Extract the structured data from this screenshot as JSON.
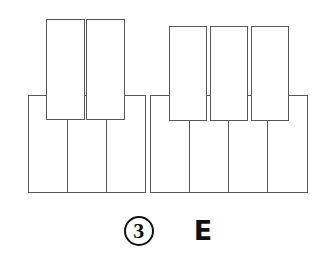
{
  "diagram": {
    "kind": "piano-keyboard",
    "octaves": 1,
    "white_key_count": 7,
    "black_key_count": 5,
    "white_key_names": [
      "C",
      "D",
      "E",
      "F",
      "G",
      "A",
      "B"
    ],
    "black_key_names": [
      "C#",
      "D#",
      "F#",
      "G#",
      "A#"
    ],
    "highlighted_note": "E",
    "outline_color": "#58585a",
    "fill_color": "#ffffff",
    "white_keys": [
      {
        "name": "white-key-c",
        "label": "C",
        "left": 28,
        "top": 95,
        "width": 41,
        "height": 98
      },
      {
        "name": "white-key-d",
        "label": "D",
        "left": 67,
        "top": 95,
        "width": 41,
        "height": 98
      },
      {
        "name": "white-key-e",
        "label": "E",
        "left": 106,
        "top": 95,
        "width": 40,
        "height": 98
      },
      {
        "name": "white-key-f",
        "label": "F",
        "left": 150,
        "top": 95,
        "width": 41,
        "height": 98
      },
      {
        "name": "white-key-g",
        "label": "G",
        "left": 189,
        "top": 95,
        "width": 41,
        "height": 98
      },
      {
        "name": "white-key-a",
        "label": "A",
        "left": 228,
        "top": 95,
        "width": 41,
        "height": 98
      },
      {
        "name": "white-key-b",
        "label": "B",
        "left": 267,
        "top": 95,
        "width": 41,
        "height": 98
      }
    ],
    "black_keys": [
      {
        "name": "black-key-c-sharp",
        "label": "C#",
        "left": 46,
        "top": 19,
        "width": 39,
        "height": 101
      },
      {
        "name": "black-key-d-sharp",
        "label": "D#",
        "left": 86,
        "top": 19,
        "width": 39,
        "height": 101
      },
      {
        "name": "black-key-f-sharp",
        "label": "F#",
        "left": 169,
        "top": 26,
        "width": 38,
        "height": 95
      },
      {
        "name": "black-key-g-sharp",
        "label": "G#",
        "left": 210,
        "top": 26,
        "width": 38,
        "height": 95
      },
      {
        "name": "black-key-a-sharp",
        "label": "A#",
        "left": 251,
        "top": 26,
        "width": 38,
        "height": 95
      }
    ]
  },
  "caption": {
    "step_number": "3",
    "note_label": "E"
  }
}
